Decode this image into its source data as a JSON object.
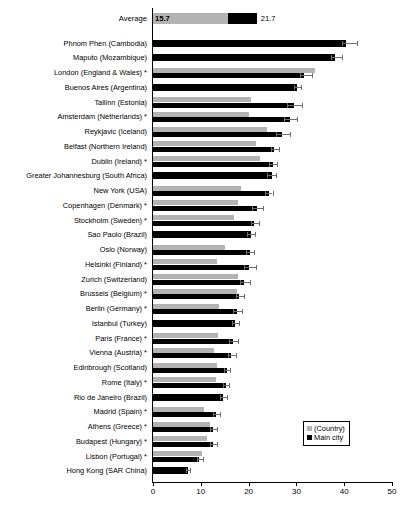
{
  "chart_data": {
    "type": "bar",
    "orientation": "horizontal",
    "title": "",
    "xlabel": "",
    "ylabel": "",
    "xlim": [
      0,
      50
    ],
    "xticks": [
      0,
      10,
      20,
      30,
      40,
      50
    ],
    "grid": false,
    "legend_position": "bottom-right",
    "legend": [
      {
        "name": "(Country)",
        "color": "#b3b3b3"
      },
      {
        "name": "Main city",
        "color": "#000000"
      }
    ],
    "series": [
      {
        "name": "(Country)",
        "color": "#b3b3b3"
      },
      {
        "name": "Main city",
        "color": "#000000"
      }
    ],
    "average_row": {
      "label": "Average",
      "country_value": 15.7,
      "city_value": 21.7,
      "country_label": "15.7",
      "city_label": "21.7"
    },
    "categories": [
      "Phnom Phen (Cambodia)",
      "Maputo (Mozambique)",
      "London (England & Wales) *",
      "Buenos Aires (Argentina)",
      "Tallinn (Estonia)",
      "Amsterdam (Netherlands) *",
      "Reykjavic (Iceland)",
      "Belfast (Northern Ireland)",
      "Dublin (Ireland) *",
      "Greater Johannesburg (South Africa)",
      "New York (USA)",
      "Copenhagen (Denmark) *",
      "Stockholm (Sweden) *",
      "Sao Paolo (Brazil)",
      "Oslo (Norway)",
      "Helsinki (Finland) *",
      "Zurich (Switzerland)",
      "Brussels (Belgium) *",
      "Berlin (Germany) *",
      "Istanbul (Turkey)",
      "Paris (France) *",
      "Vienna (Austria) *",
      "Edinbrough (Scotland)",
      "Rome (Italy) *",
      "Rio de Janeiro (Brazil)",
      "Madrid (Spain) *",
      "Athens (Greece) *",
      "Budapest (Hungary) *",
      "Lisbon (Portugal) *",
      "Hong Kong (SAR China)"
    ],
    "rows": [
      {
        "category": "Phnom Phen (Cambodia)",
        "country": null,
        "city": 40.4,
        "err_low": 39.6,
        "err_high": 42.6
      },
      {
        "category": "Maputo (Mozambique)",
        "country": null,
        "city": 38.0,
        "err_low": 37.2,
        "err_high": 39.6
      },
      {
        "category": "London (England & Wales) *",
        "country": 33.9,
        "city": 31.6,
        "err_low": 30.8,
        "err_high": 33.2
      },
      {
        "category": "Buenos Aires (Argentina)",
        "country": null,
        "city": 30.2,
        "err_low": 29.6,
        "err_high": 31.0
      },
      {
        "category": "Tallinn (Estonia)",
        "country": 20.4,
        "city": 29.4,
        "err_low": 28.0,
        "err_high": 31.2
      },
      {
        "category": "Amsterdam (Netherlands) *",
        "country": 20.0,
        "city": 28.6,
        "err_low": 27.4,
        "err_high": 30.2
      },
      {
        "category": "Reykjavic (Iceland)",
        "country": 23.8,
        "city": 27.0,
        "err_low": 25.8,
        "err_high": 28.6
      },
      {
        "category": "Belfast (Northern Ireland)",
        "country": 21.6,
        "city": 25.4,
        "err_low": 24.6,
        "err_high": 26.4
      },
      {
        "category": "Dublin (Ireland) *",
        "country": 22.4,
        "city": 25.0,
        "err_low": 24.2,
        "err_high": 26.0
      },
      {
        "category": "Greater Johannesburg (South Africa)",
        "country": null,
        "city": 24.8,
        "err_low": 23.8,
        "err_high": 25.8
      },
      {
        "category": "New York (USA)",
        "country": 18.4,
        "city": 24.2,
        "err_low": 23.4,
        "err_high": 25.0
      },
      {
        "category": "Copenhagen (Denmark) *",
        "country": 17.8,
        "city": 21.8,
        "err_low": 20.8,
        "err_high": 23.0
      },
      {
        "category": "Stockholm (Sweden) *",
        "country": 17.0,
        "city": 21.2,
        "err_low": 20.4,
        "err_high": 22.2
      },
      {
        "category": "Sao Paolo (Brazil)",
        "country": null,
        "city": 20.4,
        "err_low": 19.6,
        "err_high": 21.4
      },
      {
        "category": "Oslo (Norway)",
        "country": 15.0,
        "city": 20.2,
        "err_low": 19.4,
        "err_high": 21.2
      },
      {
        "category": "Helsinki (Finland) *",
        "country": 13.4,
        "city": 20.0,
        "err_low": 19.0,
        "err_high": 21.6
      },
      {
        "category": "Zurich (Switzerland)",
        "country": 17.8,
        "city": 19.0,
        "err_low": 18.2,
        "err_high": 20.2
      },
      {
        "category": "Brussels (Belgium) *",
        "country": 17.6,
        "city": 18.0,
        "err_low": 17.4,
        "err_high": 19.0
      },
      {
        "category": "Berlin (Germany) *",
        "country": 13.8,
        "city": 17.6,
        "err_low": 16.8,
        "err_high": 18.6
      },
      {
        "category": "Istanbul (Turkey)",
        "country": null,
        "city": 17.2,
        "err_low": 16.6,
        "err_high": 18.0
      },
      {
        "category": "Paris (France) *",
        "country": 13.6,
        "city": 16.8,
        "err_low": 16.0,
        "err_high": 17.8
      },
      {
        "category": "Vienna (Austria) *",
        "country": 12.8,
        "city": 16.4,
        "err_low": 15.6,
        "err_high": 17.4
      },
      {
        "category": "Edinbrough (Scotland)",
        "country": 13.4,
        "city": 15.4,
        "err_low": 14.8,
        "err_high": 16.2
      },
      {
        "category": "Rome (Italy) *",
        "country": 13.2,
        "city": 15.2,
        "err_low": 14.6,
        "err_high": 16.0
      },
      {
        "category": "Rio de Janeiro (Brazil)",
        "country": null,
        "city": 14.6,
        "err_low": 14.0,
        "err_high": 15.4
      },
      {
        "category": "Madrid (Spain) *",
        "country": 10.6,
        "city": 13.2,
        "err_low": 12.6,
        "err_high": 14.0
      },
      {
        "category": "Athens (Greece) *",
        "country": 12.0,
        "city": 12.6,
        "err_low": 12.0,
        "err_high": 13.4
      },
      {
        "category": "Budapest (Hungary) *",
        "country": 11.4,
        "city": 12.6,
        "err_low": 12.0,
        "err_high": 13.4
      },
      {
        "category": "Lisbon (Portugal) *",
        "country": 10.2,
        "city": 9.6,
        "err_low": 9.2,
        "err_high": 10.4
      },
      {
        "category": "Hong Kong (SAR China)",
        "country": null,
        "city": 7.4,
        "err_low": 7.0,
        "err_high": 7.8
      }
    ]
  }
}
